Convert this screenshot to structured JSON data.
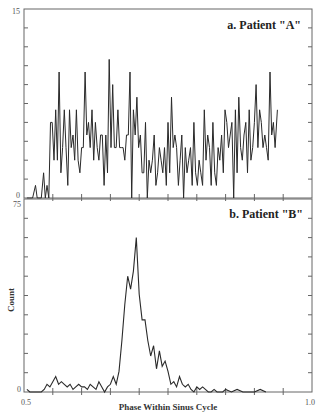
{
  "chart_data": [
    {
      "type": "line",
      "title": "a. Patient \"A\"",
      "xlabel": "Phase Within Sinus Cycle",
      "ylabel": "Count",
      "xlim": [
        0.5,
        1.0
      ],
      "ylim": [
        0,
        15
      ],
      "ytick_labels": [
        "0",
        "15"
      ],
      "grid": false,
      "x": [
        0.505,
        0.51,
        0.515,
        0.52,
        0.523,
        0.526,
        0.53,
        0.534,
        0.537,
        0.54,
        0.543,
        0.546,
        0.549,
        0.552,
        0.555,
        0.558,
        0.561,
        0.564,
        0.567,
        0.57,
        0.573,
        0.576,
        0.579,
        0.582,
        0.585,
        0.588,
        0.591,
        0.594,
        0.597,
        0.6,
        0.603,
        0.606,
        0.609,
        0.612,
        0.615,
        0.618,
        0.621,
        0.624,
        0.627,
        0.63,
        0.633,
        0.636,
        0.639,
        0.642,
        0.645,
        0.648,
        0.651,
        0.654,
        0.657,
        0.66,
        0.663,
        0.666,
        0.669,
        0.672,
        0.675,
        0.678,
        0.681,
        0.684,
        0.687,
        0.69,
        0.693,
        0.696,
        0.699,
        0.702,
        0.705,
        0.708,
        0.711,
        0.714,
        0.717,
        0.72,
        0.723,
        0.726,
        0.729,
        0.732,
        0.735,
        0.738,
        0.741,
        0.744,
        0.747,
        0.75,
        0.753,
        0.756,
        0.759,
        0.762,
        0.765,
        0.768,
        0.771,
        0.774,
        0.777,
        0.78,
        0.783,
        0.786,
        0.789,
        0.792,
        0.795,
        0.798,
        0.801,
        0.804,
        0.807,
        0.81,
        0.813,
        0.816,
        0.819,
        0.822,
        0.825,
        0.828,
        0.831,
        0.834,
        0.837,
        0.84,
        0.843,
        0.846,
        0.849,
        0.852,
        0.855,
        0.858,
        0.861,
        0.864,
        0.867,
        0.87,
        0.873,
        0.876,
        0.879,
        0.882,
        0.885,
        0.888,
        0.891,
        0.894,
        0.897,
        0.9,
        0.903,
        0.906,
        0.909,
        0.912,
        0.915,
        0.918,
        0.921,
        0.924,
        0.927,
        0.93,
        0.933,
        0.936,
        0.94
      ],
      "values": [
        0,
        0,
        0,
        1,
        0,
        0,
        0,
        2,
        0,
        1,
        0,
        6,
        6,
        3,
        7,
        3,
        10,
        2,
        4,
        7,
        4,
        1,
        7,
        4,
        5,
        3,
        7,
        3,
        2,
        4,
        4,
        10,
        5,
        6,
        4,
        7,
        3,
        6,
        4,
        3,
        5,
        5,
        1,
        5,
        2,
        11,
        4,
        9,
        4,
        4,
        7,
        4,
        4,
        4,
        3,
        5,
        5,
        10,
        0,
        7,
        5,
        8,
        4,
        5,
        2,
        2,
        6,
        0,
        3,
        2,
        3,
        5,
        1,
        2,
        4,
        3,
        2,
        4,
        1,
        6,
        2,
        8,
        4,
        5,
        4,
        1,
        3,
        5,
        0,
        4,
        2,
        3,
        4,
        1,
        6,
        2,
        1,
        3,
        2,
        1,
        7,
        3,
        5,
        4,
        1,
        6,
        2,
        1,
        4,
        3,
        5,
        2,
        7,
        6,
        4,
        5,
        6,
        0,
        7,
        2,
        8,
        4,
        3,
        5,
        6,
        2,
        7,
        3,
        4,
        6,
        9,
        4,
        7,
        6,
        4,
        5,
        4,
        3,
        10,
        5,
        6,
        4,
        7,
        3,
        2,
        5,
        4,
        2,
        3,
        2,
        6,
        0,
        0
      ],
      "x_tick_labels": [
        "0.5",
        "1.0"
      ]
    },
    {
      "type": "line",
      "title": "b. Patient \"B\"",
      "xlabel": "Phase Within Sinus Cycle",
      "ylabel": "Count",
      "xlim": [
        0.5,
        1.0
      ],
      "ylim": [
        0,
        75
      ],
      "ytick_labels": [
        "0",
        "75"
      ],
      "grid": false,
      "x": [
        0.505,
        0.51,
        0.515,
        0.52,
        0.525,
        0.53,
        0.535,
        0.54,
        0.545,
        0.55,
        0.555,
        0.56,
        0.565,
        0.57,
        0.575,
        0.58,
        0.585,
        0.59,
        0.595,
        0.6,
        0.605,
        0.61,
        0.615,
        0.62,
        0.625,
        0.63,
        0.635,
        0.64,
        0.645,
        0.65,
        0.655,
        0.66,
        0.665,
        0.67,
        0.675,
        0.68,
        0.685,
        0.69,
        0.695,
        0.7,
        0.705,
        0.71,
        0.715,
        0.72,
        0.725,
        0.73,
        0.735,
        0.74,
        0.745,
        0.75,
        0.755,
        0.76,
        0.765,
        0.77,
        0.775,
        0.78,
        0.785,
        0.79,
        0.795,
        0.8,
        0.805,
        0.81,
        0.815,
        0.82,
        0.825,
        0.83,
        0.835,
        0.84,
        0.845,
        0.85,
        0.86,
        0.87,
        0.88,
        0.89,
        0.9,
        0.91,
        0.92
      ],
      "values": [
        1,
        0,
        0,
        0,
        0,
        0,
        1,
        3,
        2,
        4,
        6,
        3,
        4,
        3,
        2,
        3,
        1,
        2,
        3,
        2,
        2,
        1,
        3,
        2,
        1,
        4,
        2,
        0,
        2,
        3,
        6,
        3,
        8,
        20,
        34,
        45,
        40,
        47,
        60,
        38,
        28,
        28,
        20,
        14,
        18,
        9,
        16,
        10,
        12,
        8,
        3,
        4,
        2,
        6,
        3,
        2,
        3,
        1,
        0,
        2,
        1,
        2,
        1,
        0,
        0,
        1,
        0,
        0,
        0,
        1,
        0,
        1,
        0,
        0,
        0,
        1,
        0
      ],
      "x_tick_labels": [
        "0.5",
        "1.0"
      ]
    }
  ],
  "axes": {
    "a": {
      "title": "a. Patient \"A\"",
      "ymax_label": "15",
      "ymin_label": "0"
    },
    "b": {
      "title": "b. Patient \"B\"",
      "ymax_label": "75",
      "ymin_label": "0"
    },
    "xlabel": "Phase Within Sinus Cycle",
    "ylabel": "Count",
    "xmin_label": "0.5",
    "xmax_label": "1.0"
  },
  "colors": {
    "line": "#2a2a2a",
    "frame": "#666666",
    "text": "#222222"
  }
}
